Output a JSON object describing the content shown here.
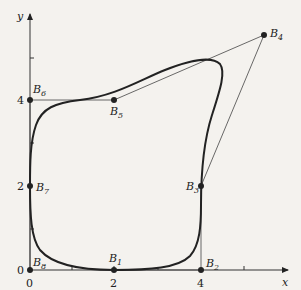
{
  "figure": {
    "axes": {
      "x_label": "x",
      "y_label": "y",
      "x_ticks": [
        {
          "value": 0,
          "label": "0"
        },
        {
          "value": 2,
          "label": "2"
        },
        {
          "value": 4,
          "label": "4"
        }
      ],
      "y_ticks": [
        {
          "value": 0,
          "label": "0"
        },
        {
          "value": 2,
          "label": "2"
        },
        {
          "value": 4,
          "label": "4"
        }
      ]
    },
    "control_points": [
      {
        "name": "B",
        "sub": "1",
        "x": 2,
        "y": 0
      },
      {
        "name": "B",
        "sub": "2",
        "x": 4,
        "y": 0
      },
      {
        "name": "B",
        "sub": "3",
        "x": 4,
        "y": 2
      },
      {
        "name": "B",
        "sub": "4",
        "x": 5.5,
        "y": 5.5
      },
      {
        "name": "B",
        "sub": "5",
        "x": 2,
        "y": 4
      },
      {
        "name": "B",
        "sub": "6",
        "x": 0,
        "y": 4
      },
      {
        "name": "B",
        "sub": "7",
        "x": 0,
        "y": 2
      },
      {
        "name": "B",
        "sub": "8",
        "x": 0,
        "y": 0
      }
    ],
    "curve_description": "Closed periodic B-spline curve defined by control polygon B1..B8"
  }
}
